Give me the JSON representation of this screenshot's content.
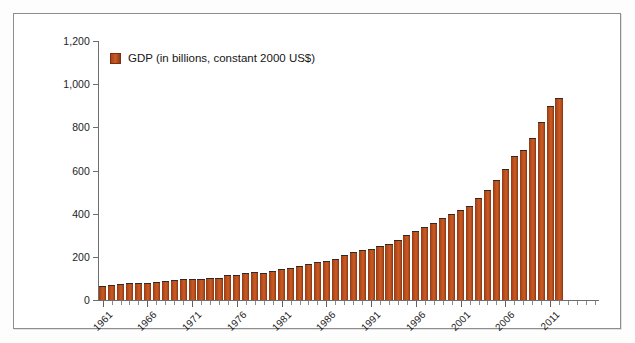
{
  "chart_data": {
    "type": "bar",
    "title": "",
    "subtitle": "",
    "xlabel": "",
    "ylabel": "",
    "ylim": [
      0,
      1200
    ],
    "ytick_labels": [
      "0",
      "200",
      "400",
      "600",
      "800",
      "1,000",
      "1,200"
    ],
    "ytick_values": [
      0,
      200,
      400,
      600,
      800,
      1000,
      1200
    ],
    "grid": false,
    "legend_position": "top-left",
    "legend": [
      "GDP (in billions, constant 2000 US$)"
    ],
    "series": [
      {
        "name": "GDP (in billions, constant 2000 US$)",
        "color": "#C8501E",
        "values": [
          66,
          70,
          74,
          80,
          77,
          78,
          85,
          87,
          93,
          98,
          99,
          98,
          102,
          104,
          114,
          116,
          125,
          132,
          125,
          134,
          143,
          148,
          159,
          166,
          175,
          183,
          190,
          209,
          222,
          234,
          236,
          249,
          261,
          278,
          299,
          321,
          336,
          356,
          381,
          397,
          419,
          435,
          471,
          510,
          558,
          609,
          669,
          696,
          750,
          824,
          901,
          936
        ],
        "x": [
          1961,
          1962,
          1963,
          1964,
          1965,
          1966,
          1967,
          1968,
          1969,
          1970,
          1971,
          1972,
          1973,
          1974,
          1975,
          1976,
          1977,
          1978,
          1979,
          1980,
          1981,
          1982,
          1983,
          1984,
          1985,
          1986,
          1987,
          1988,
          1989,
          1990,
          1991,
          1992,
          1993,
          1994,
          1995,
          1996,
          1997,
          1998,
          1999,
          2000,
          2001,
          2002,
          2003,
          2004,
          2005,
          2006,
          2007,
          2008,
          2009,
          2010,
          2011,
          2012
        ]
      }
    ],
    "xtick_labels": [
      "1961",
      "1966",
      "1971",
      "1976",
      "1981",
      "1986",
      "1991",
      "1996",
      "2001",
      "2006",
      "2011"
    ],
    "xtick_values": [
      1961,
      1966,
      1971,
      1976,
      1981,
      1986,
      1991,
      1996,
      2001,
      2006,
      2011
    ]
  }
}
